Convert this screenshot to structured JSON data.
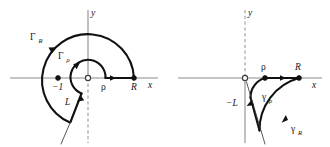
{
  "figure": {
    "colors": {
      "axis": "#8c8c8c",
      "contour": "#111111",
      "label": "#151515",
      "background": "#ffffff"
    },
    "panels": [
      {
        "name": "left-panel",
        "description": "Keyhole-style contour with large arc Gamma_R, small arc Gamma_rho, branch cut ray L",
        "axes": {
          "x_label": "x",
          "y_label": "y",
          "y_axis_upper_style": "solid",
          "y_axis_lower_style": "dashed"
        },
        "points": [
          {
            "name": "minus-one",
            "label": "−1",
            "marker": "filled-dot"
          },
          {
            "name": "origin",
            "label": "",
            "marker": "open-circle"
          },
          {
            "name": "rho",
            "label": "ρ",
            "marker": "none"
          },
          {
            "name": "big-r",
            "label": "R",
            "marker": "filled-dot"
          }
        ],
        "curves": [
          {
            "name": "gamma-big-r-arc",
            "label_base": "Γ",
            "label_sub": "R",
            "direction": "counterclockwise"
          },
          {
            "name": "gamma-rho-arc",
            "label_base": "Γ",
            "label_sub": "ρ",
            "direction": "counterclockwise"
          },
          {
            "name": "ray-l",
            "label_base": "L",
            "label_sub": "",
            "direction": "toward-origin"
          }
        ]
      },
      {
        "name": "right-panel",
        "description": "Sector contour in lower half with arcs gamma_rho and gamma_R and ray minus L",
        "axes": {
          "x_label": "x",
          "y_label": "y",
          "y_axis_upper_style": "dashed",
          "y_axis_lower_style": "solid"
        },
        "points": [
          {
            "name": "origin",
            "label": "",
            "marker": "open-circle"
          },
          {
            "name": "rho",
            "label": "ρ",
            "marker": "filled-dot"
          },
          {
            "name": "big-r",
            "label": "R",
            "marker": "filled-dot"
          }
        ],
        "curves": [
          {
            "name": "gamma-rho-arc",
            "label_base": "γ",
            "label_sub": "ρ",
            "direction": "clockwise"
          },
          {
            "name": "gamma-big-r-arc",
            "label_base": "γ",
            "label_sub": "R",
            "direction": "counterclockwise"
          },
          {
            "name": "ray-minus-l",
            "label_base": "−L",
            "label_sub": "",
            "direction": "toward-origin"
          }
        ]
      }
    ]
  }
}
